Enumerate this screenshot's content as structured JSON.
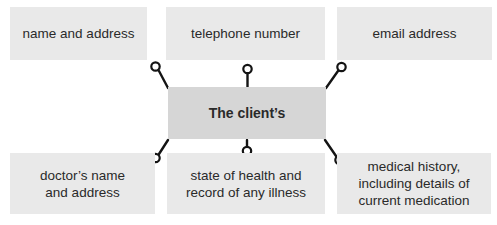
{
  "diagram": {
    "center": {
      "label": "The client’s"
    },
    "nodes": [
      {
        "id": "name-and-address",
        "position": "top-left",
        "text": "name and address"
      },
      {
        "id": "telephone-number",
        "position": "top-center",
        "text": "telephone number"
      },
      {
        "id": "email-address",
        "position": "top-right",
        "text": "email address"
      },
      {
        "id": "doctors-name",
        "position": "bottom-left",
        "text": "doctor’s name\nand address"
      },
      {
        "id": "state-of-health",
        "position": "bottom-center",
        "text": "state of health and\nrecord of any illness"
      },
      {
        "id": "medical-history",
        "position": "bottom-right",
        "text": "medical history,\nincluding details of\ncurrent medication"
      }
    ],
    "colors": {
      "background": "#ffffff",
      "node_fill": "#e9e9e9",
      "center_fill": "#d6d6d6",
      "text": "#2a2a2a",
      "connector": "#141414"
    }
  }
}
